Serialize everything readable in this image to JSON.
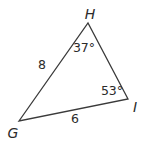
{
  "figure": {
    "type": "triangle-diagram",
    "background": "#ffffff",
    "line_color": "#3a3a3a",
    "text_color": "#2b2b2b",
    "vertices": {
      "G": {
        "label": "G"
      },
      "H": {
        "label": "H"
      },
      "I": {
        "label": "I"
      }
    },
    "angles": {
      "H": {
        "value": "37°"
      },
      "I": {
        "value": "53°"
      }
    },
    "sides": {
      "GH": {
        "length": "8"
      },
      "GI": {
        "length": "6"
      }
    }
  }
}
